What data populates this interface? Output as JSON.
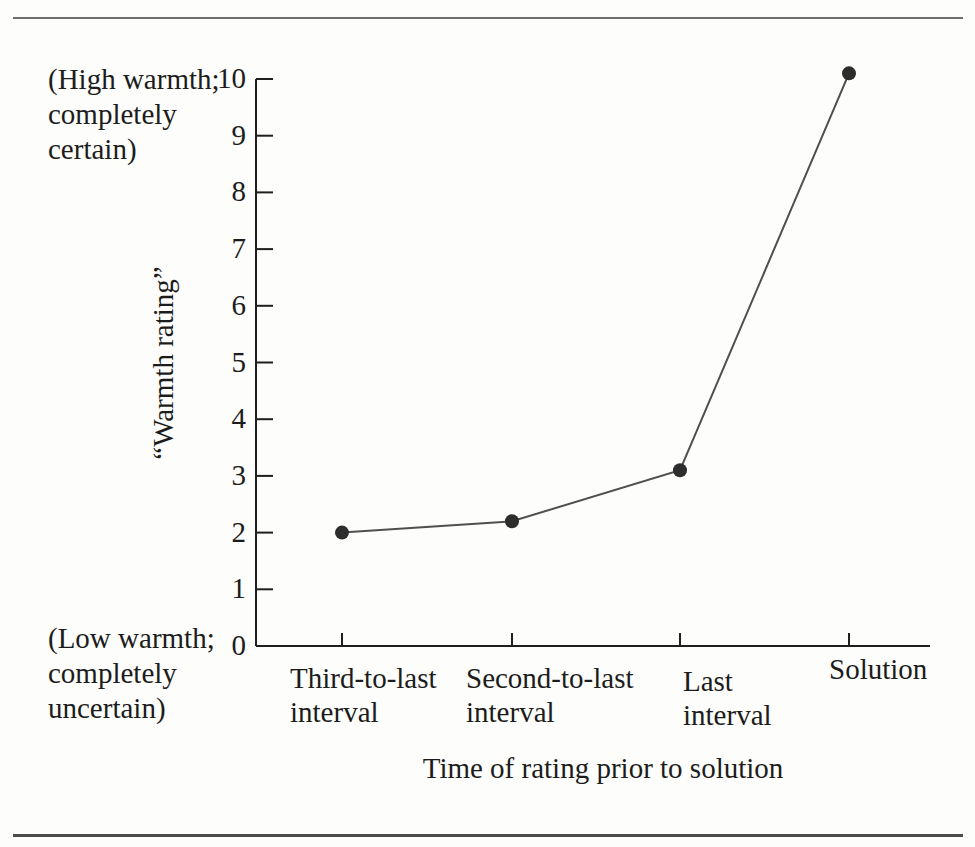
{
  "figure": {
    "background": "#fdfdfb",
    "text_color": "#1c1c1c",
    "top_rule_color": "#6f6f6f",
    "bottom_rule_color": "#4c4c4c"
  },
  "chart_data": {
    "type": "line",
    "title": "",
    "xlabel": "Time of rating prior to solution",
    "ylabel": "“Warmth rating”",
    "categories": [
      "Third-to-last\ninterval",
      "Second-to-last\ninterval",
      "Last\ninterval",
      "Solution"
    ],
    "values": [
      2.0,
      2.2,
      3.1,
      10.1
    ],
    "ylim": [
      0,
      10
    ],
    "y_ticks": [
      0,
      1,
      2,
      3,
      4,
      5,
      6,
      7,
      8,
      9,
      10
    ],
    "y_annotation_high": "(High warmth;\ncompletely\ncertain)",
    "y_annotation_low": "(Low warmth;\ncompletely\nuncertain)",
    "grid": false,
    "legend": "none",
    "marker": "filled-circle",
    "axis_color": "#1f1f1f",
    "line_color": "#4f4f4f",
    "marker_color": "#2d2d2d"
  }
}
